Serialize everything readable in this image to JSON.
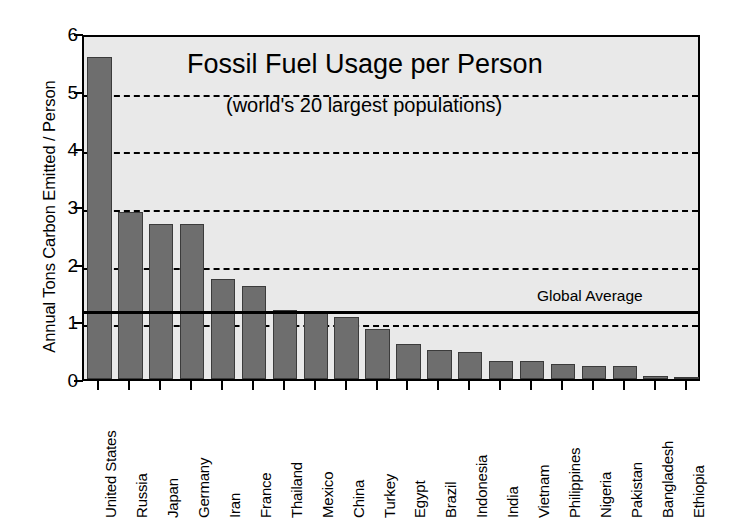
{
  "chart_data": {
    "type": "bar",
    "title": "Fossil Fuel Usage per Person",
    "subtitle": "(world's 20 largest populations)",
    "xlabel": "",
    "ylabel": "Annual Tons Carbon Emitted / Person",
    "ylim": [
      0,
      6
    ],
    "yticks": [
      0,
      1,
      2,
      3,
      4,
      5,
      6
    ],
    "ytick_labels": [
      "0",
      "1",
      "2",
      "3",
      "4",
      "5",
      "6"
    ],
    "gridlines": [
      1,
      2,
      3,
      4,
      5
    ],
    "grid": true,
    "legend": "none",
    "categories": [
      "United States",
      "Russia",
      "Japan",
      "Germany",
      "Iran",
      "France",
      "Thailand",
      "Mexico",
      "China",
      "Turkey",
      "Egypt",
      "Brazil",
      "Indonesia",
      "India",
      "Vietnam",
      "Philippines",
      "Nigeria",
      "Pakistan",
      "Bangladesh",
      "Ethiopia"
    ],
    "values": [
      5.58,
      2.89,
      2.68,
      2.68,
      1.73,
      1.62,
      1.19,
      1.17,
      1.07,
      0.87,
      0.6,
      0.5,
      0.46,
      0.32,
      0.31,
      0.26,
      0.23,
      0.22,
      0.05,
      0.01
    ],
    "annotations": [
      {
        "name": "global-average",
        "label": "Global Average",
        "value": 1.25
      }
    ],
    "colors": {
      "bar_fill": "#6e6e6e",
      "bar_edge": "#3b3b3b",
      "plot_background": "#e9e9e9",
      "axis": "#000000",
      "grid": "#000000",
      "average_line": "#000000",
      "page_background": "#ffffff"
    }
  }
}
